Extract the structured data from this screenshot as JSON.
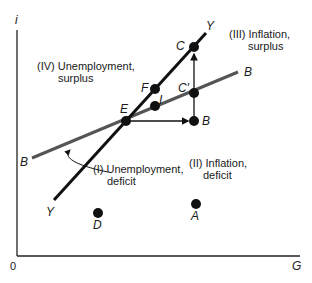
{
  "axes": {
    "y_label": "i",
    "x_label": "G",
    "origin_label": "0"
  },
  "lines": {
    "yy": {
      "start_label": "Y",
      "end_label": "Y"
    },
    "bb": {
      "start_label": "B",
      "end_label": "B"
    }
  },
  "points": {
    "E": "E",
    "F": "F",
    "I": "I",
    "C": "C",
    "C_prime": "C′",
    "B": "B",
    "D": "D",
    "A": "A"
  },
  "regions": {
    "I": {
      "line1": "(I) Unemployment,",
      "line2": "deficit"
    },
    "II": {
      "line1": "(II) Inflation,",
      "line2": "deficit"
    },
    "III": {
      "line1": "(III) Inflation,",
      "line2": "surplus"
    },
    "IV": {
      "line1": "(IV) Unemployment,",
      "line2": "surplus"
    }
  },
  "colors": {
    "yy_line": "#111111",
    "bb_line": "#555555",
    "points": "#111111"
  }
}
